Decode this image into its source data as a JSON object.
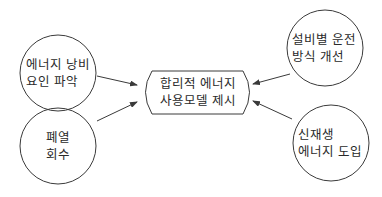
{
  "diagram": {
    "center": {
      "line1": "합리적 에너지",
      "line2": "사용모델 제시"
    },
    "nodes": [
      {
        "id": "waste-factor",
        "line1": "에너지 낭비",
        "line2": "요인 파악"
      },
      {
        "id": "waste-heat",
        "line1": "폐열",
        "line2": "회수"
      },
      {
        "id": "equipment-operation",
        "line1": "설비별 운전",
        "line2": "방식 개선"
      },
      {
        "id": "renewable",
        "line1": "신재생",
        "line2": "에너지 도입"
      }
    ],
    "colors": {
      "stroke": "#3a3a3a",
      "text": "#2a2a2a",
      "background": "#ffffff"
    }
  }
}
